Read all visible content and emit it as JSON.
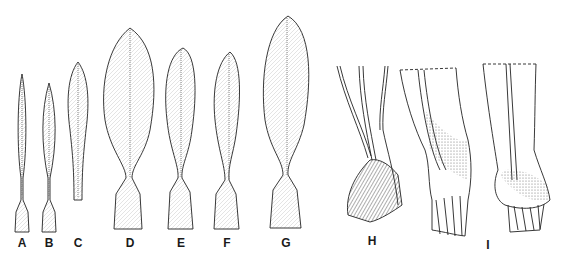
{
  "figure": {
    "ink_color": "#222222",
    "background": "#ffffff",
    "panels": [
      {
        "id": "A",
        "label": "A",
        "type": "leaf",
        "x": 22
      },
      {
        "id": "B",
        "label": "B",
        "type": "leaf",
        "x": 47
      },
      {
        "id": "C",
        "label": "C",
        "type": "leaf",
        "x": 77
      },
      {
        "id": "D",
        "label": "D",
        "type": "leaf",
        "x": 130
      },
      {
        "id": "E",
        "label": "E",
        "type": "leaf",
        "x": 181
      },
      {
        "id": "F",
        "label": "F",
        "type": "leaf",
        "x": 227
      },
      {
        "id": "G",
        "label": "G",
        "type": "leaf",
        "x": 286
      },
      {
        "id": "H",
        "label": "H",
        "type": "stem-base",
        "x": 372
      },
      {
        "id": "I",
        "label": "I",
        "type": "stem-base",
        "x": 488
      }
    ]
  }
}
